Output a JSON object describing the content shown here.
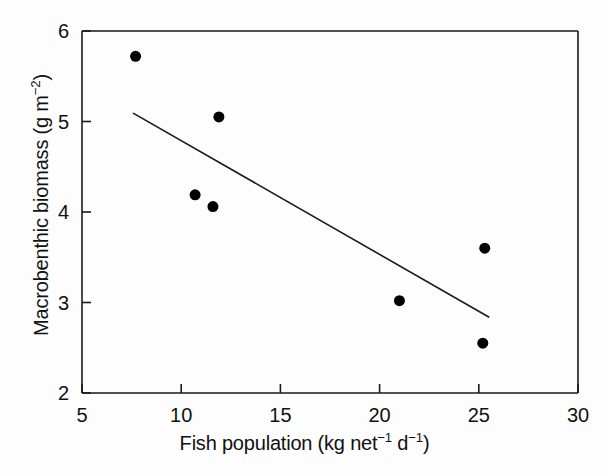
{
  "chart_data": {
    "type": "scatter",
    "title": "",
    "xlabel_plain": "Fish population (kg net-1 d-1)",
    "ylabel_plain": "Macrobenthic biomass (g m-2)",
    "xlabel_parts": {
      "main": "Fish population (kg net",
      "sup1": "−1",
      "mid": " d",
      "sup2": "−1",
      "end": ")"
    },
    "ylabel_parts": {
      "main": "Macrobenthic biomass (g m",
      "sup1": "−2",
      "end": ")"
    },
    "xlim": [
      5,
      30
    ],
    "ylim": [
      2,
      6
    ],
    "xticks": [
      5,
      10,
      15,
      20,
      25,
      30
    ],
    "yticks": [
      2,
      3,
      4,
      5,
      6
    ],
    "xtick_labels": [
      "5",
      "10",
      "15",
      "20",
      "25",
      "30"
    ],
    "ytick_labels": [
      "2",
      "3",
      "4",
      "5",
      "6"
    ],
    "grid": false,
    "legend": null,
    "marker": "filled-circle",
    "marker_color": "#000000",
    "marker_size_px": 11,
    "points": [
      {
        "x": 7.7,
        "y": 5.72
      },
      {
        "x": 11.9,
        "y": 5.05
      },
      {
        "x": 10.7,
        "y": 4.19
      },
      {
        "x": 11.6,
        "y": 4.06
      },
      {
        "x": 21.0,
        "y": 3.02
      },
      {
        "x": 25.3,
        "y": 3.6
      },
      {
        "x": 25.2,
        "y": 2.55
      }
    ],
    "trend_line": {
      "type": "linear-regression",
      "x_start": 7.6,
      "y_start": 5.09,
      "x_end": 25.5,
      "y_end": 2.84,
      "color": "#1a1a1a",
      "width_px": 1.6
    },
    "frame": {
      "color": "#1a1a1a",
      "width_px": 1.6,
      "sides": [
        "left",
        "bottom"
      ],
      "top_rule": true,
      "right_rule": true
    }
  }
}
